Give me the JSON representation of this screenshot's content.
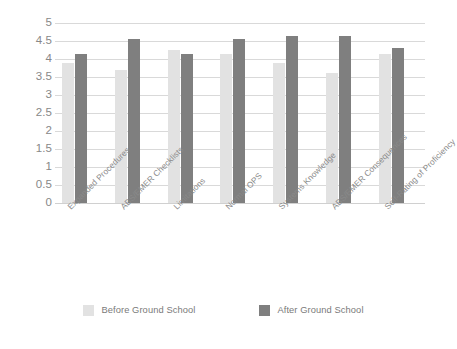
{
  "chart_data": {
    "type": "bar",
    "title": "",
    "xlabel": "",
    "ylabel": "",
    "ylim": [
      0,
      5
    ],
    "ytick_step": 0.5,
    "yticks": [
      "5",
      "4.5",
      "4",
      "3.5",
      "3",
      "2.5",
      "2",
      "1.5",
      "1",
      "0.5",
      "0"
    ],
    "grid": true,
    "legend_position": "bottom",
    "categories": [
      "Expanded Procedures",
      "ABS/EMER Checklists",
      "Limitations",
      "Normal OPS",
      "Systems Knowledge",
      "ABS/EMER Consequences",
      "Self-Rating of Proficiency"
    ],
    "series": [
      {
        "name": "Before Ground School",
        "color": "#e2e2e2",
        "values": [
          3.9,
          3.7,
          4.25,
          4.15,
          3.9,
          3.6,
          4.15
        ]
      },
      {
        "name": "After Ground School",
        "color": "#7f7f7f",
        "values": [
          4.15,
          4.55,
          4.15,
          4.55,
          4.65,
          4.65,
          4.3
        ]
      }
    ]
  },
  "legend": {
    "items": [
      {
        "label": "Before Ground School",
        "swatch": "before"
      },
      {
        "label": "After Ground School",
        "swatch": "after"
      }
    ]
  }
}
